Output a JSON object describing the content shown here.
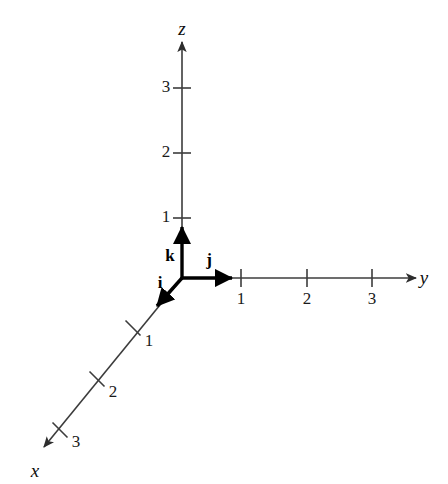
{
  "figure": {
    "background_color": "#ffffff",
    "axis_color": "#3c3c3c",
    "vector_color": "#000000",
    "text_color": "#1a1a1a",
    "width": 448,
    "height": 484
  },
  "axes": [
    {
      "id": "x",
      "label": "x",
      "label_x": 35,
      "label_y": 470,
      "origin_x": 182,
      "origin_y": 278,
      "tip_x": 38,
      "tip_y": 453,
      "direction": "down-left",
      "tick_labels": [
        "1",
        "2",
        "3"
      ],
      "ticks": [
        {
          "value": "1",
          "x": 133,
          "y": 328,
          "label_x": 149,
          "label_y": 340
        },
        {
          "value": "2",
          "x": 97,
          "y": 379,
          "label_x": 113,
          "label_y": 391
        },
        {
          "value": "3",
          "x": 60,
          "y": 430,
          "label_x": 76,
          "label_y": 441
        }
      ]
    },
    {
      "id": "y",
      "label": "y",
      "label_x": 424,
      "label_y": 277,
      "origin_x": 182,
      "origin_y": 278,
      "tip_x": 410,
      "tip_y": 278,
      "direction": "right",
      "tick_labels": [
        "1",
        "2",
        "3"
      ],
      "ticks": [
        {
          "value": "1",
          "x": 241,
          "y": 278,
          "label_x": 241,
          "label_y": 298
        },
        {
          "value": "2",
          "x": 307,
          "y": 278,
          "label_x": 307,
          "label_y": 298
        },
        {
          "value": "3",
          "x": 372,
          "y": 278,
          "label_x": 372,
          "label_y": 298
        }
      ]
    },
    {
      "id": "z",
      "label": "z",
      "label_x": 182,
      "label_y": 28,
      "origin_x": 182,
      "origin_y": 278,
      "tip_x": 182,
      "tip_y": 48,
      "direction": "up",
      "tick_labels": [
        "1",
        "2",
        "3"
      ],
      "ticks": [
        {
          "value": "1",
          "x": 182,
          "y": 218,
          "label_x": 166,
          "label_y": 216
        },
        {
          "value": "2",
          "x": 182,
          "y": 153,
          "label_x": 166,
          "label_y": 151
        },
        {
          "value": "3",
          "x": 182,
          "y": 88,
          "label_x": 166,
          "label_y": 86
        }
      ]
    }
  ],
  "unit_vectors": [
    {
      "id": "i",
      "label": "i",
      "axis": "x",
      "start_x": 182,
      "start_y": 278,
      "end_x": 152,
      "end_y": 312,
      "label_x": 160,
      "label_y": 282
    },
    {
      "id": "j",
      "label": "j",
      "axis": "y",
      "start_x": 182,
      "start_y": 278,
      "end_x": 241,
      "end_y": 278,
      "label_x": 209,
      "label_y": 259
    },
    {
      "id": "k",
      "label": "k",
      "axis": "z",
      "start_x": 182,
      "start_y": 278,
      "end_x": 182,
      "end_y": 218,
      "label_x": 170,
      "label_y": 255
    }
  ]
}
